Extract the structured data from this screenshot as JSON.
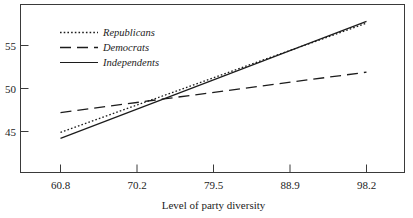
{
  "chart_data": {
    "type": "line",
    "title": "",
    "subtitle": "",
    "xlabel": "Level of party diversity",
    "ylabel": "",
    "xlim": [
      57.0,
      101.5
    ],
    "ylim": [
      40.5,
      59.5
    ],
    "xticks": [
      "60.8",
      "70.2",
      "79.5",
      "88.9",
      "98.2"
    ],
    "xtick_values": [
      60.8,
      70.2,
      79.5,
      88.9,
      98.2
    ],
    "yticks": [
      "45",
      "50",
      "55"
    ],
    "ytick_values": [
      45,
      50,
      55
    ],
    "grid": false,
    "legend_position": "top-left",
    "x": [
      60.8,
      98.2
    ],
    "series": [
      {
        "name": "Republicans",
        "style": "dotted",
        "color": "#1c1c1c",
        "values": [
          44.9,
          57.6
        ]
      },
      {
        "name": "Democrats",
        "style": "dashed",
        "color": "#1c1c1c",
        "values": [
          47.2,
          51.9
        ]
      },
      {
        "name": "Independents",
        "style": "solid",
        "color": "#1c1c1c",
        "values": [
          44.2,
          57.8
        ]
      }
    ]
  },
  "figure": {
    "frame_color": "#3a3a3a",
    "background": "#ffffff",
    "ink_color": "#1c1c1c"
  },
  "legend": {
    "entries": [
      {
        "label": "Republicans",
        "swatch": "dotted-line-swatch"
      },
      {
        "label": "Democrats",
        "swatch": "dashed-line-swatch"
      },
      {
        "label": "Independents",
        "swatch": "solid-line-swatch"
      }
    ]
  },
  "axis": {
    "x_title": "Level of party diversity",
    "x_tick_labels": [
      "60.8",
      "70.2",
      "79.5",
      "88.9",
      "98.2"
    ],
    "y_tick_labels": [
      "55",
      "50",
      "45"
    ]
  }
}
